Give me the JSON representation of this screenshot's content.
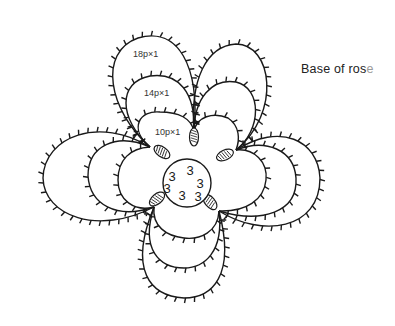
{
  "caption": {
    "text": "Base of ros",
    "faded_tail": "e"
  },
  "colors": {
    "line": "#1a1a1a",
    "background": "#ffffff",
    "label": "#333333"
  },
  "labels": [
    {
      "id": "outer",
      "text": "18p×1",
      "x": 133,
      "y": 57
    },
    {
      "id": "middle",
      "text": "14p×1",
      "x": 144,
      "y": 96
    },
    {
      "id": "inner",
      "text": "10p×1",
      "x": 155,
      "y": 135
    }
  ],
  "center_ring": {
    "cx": 187,
    "cy": 183,
    "r": 24,
    "double_stitch_counts": [
      {
        "text": "3",
        "x": 172,
        "y": 178
      },
      {
        "text": "3",
        "x": 190,
        "y": 172
      },
      {
        "text": "3",
        "x": 200,
        "y": 185
      },
      {
        "text": "3",
        "x": 167,
        "y": 190
      },
      {
        "text": "3",
        "x": 182,
        "y": 197
      },
      {
        "text": "3",
        "x": 198,
        "y": 198
      }
    ]
  },
  "joins": [
    {
      "cx": 162,
      "cy": 152,
      "rx": 9,
      "ry": 5,
      "rot": 35
    },
    {
      "cx": 194,
      "cy": 137,
      "rx": 4.5,
      "ry": 9,
      "rot": 0
    },
    {
      "cx": 225,
      "cy": 155,
      "rx": 9,
      "ry": 5,
      "rot": -25
    },
    {
      "cx": 210,
      "cy": 202,
      "rx": 9,
      "ry": 5,
      "rot": 50
    },
    {
      "cx": 157,
      "cy": 199,
      "rx": 9,
      "ry": 5,
      "rot": -40
    }
  ],
  "petals": [
    {
      "name": "upper-left",
      "loops": [
        "M150,147 C128,128 140,110 160,112 C178,112 192,118 194,132",
        "M150,147 C118,118 118,82 150,76 C178,72 196,92 194,132",
        "M150,147 C108,110 98,52 138,38 C178,26 200,66 194,132"
      ]
    },
    {
      "name": "upper-right",
      "loops": [
        "M194,132 C196,116 214,112 228,118 C240,126 240,140 236,150",
        "M194,132 C194,98 212,78 236,82 C262,88 262,130 236,150",
        "M194,132 C190,80 206,46 236,44 C272,44 282,112 236,150"
      ]
    },
    {
      "name": "right",
      "loops": [
        "M236,150 C254,148 268,162 266,180 C264,200 246,212 219,211",
        "M236,150 C266,138 294,150 296,178 C298,212 262,224 219,211",
        "M236,150 C280,122 318,140 320,178 C320,230 262,238 219,211"
      ]
    },
    {
      "name": "bottom",
      "loops": [
        "M219,211 C218,232 200,240 184,238 C166,236 152,226 154,207",
        "M219,211 C224,252 204,268 184,268 C160,268 140,250 154,207",
        "M219,211 C236,276 212,298 184,298 C150,296 128,270 154,207"
      ]
    },
    {
      "name": "left",
      "loops": [
        "M154,207 C134,212 118,200 118,180 C118,160 130,148 150,147",
        "M154,207 C116,220 90,204 88,176 C88,146 116,132 150,147",
        "M154,207 C98,236 44,216 43,178 C44,136 100,116 150,147"
      ]
    }
  ]
}
